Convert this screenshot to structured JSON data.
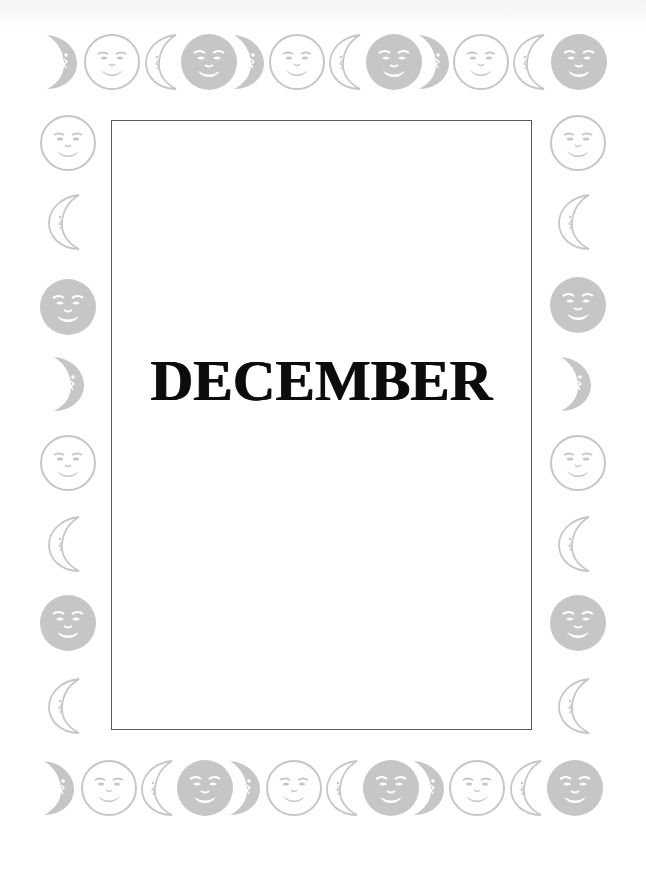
{
  "page": {
    "title": "DECEMBER",
    "colors": {
      "moon_gray": "#c6c6c6",
      "frame_border": "#5a5a5a",
      "title_ink": "#0c0c0c",
      "background": "#ffffff"
    }
  },
  "border": {
    "top_row": [
      "crescent-filled",
      "face-outline",
      "crescent-outline",
      "face-filled",
      "crescent-filled",
      "face-outline",
      "crescent-outline",
      "face-filled",
      "crescent-filled",
      "face-outline",
      "crescent-outline",
      "face-filled"
    ],
    "left_column": [
      "face-outline",
      "crescent-outline",
      "face-filled",
      "crescent-filled",
      "face-outline",
      "crescent-outline",
      "face-filled",
      "crescent-outline"
    ],
    "right_column": [
      "face-outline",
      "crescent-outline",
      "face-filled",
      "crescent-filled",
      "face-outline",
      "crescent-outline",
      "face-filled",
      "crescent-outline"
    ],
    "bottom_row": [
      "crescent-filled",
      "face-outline",
      "crescent-outline",
      "face-filled",
      "crescent-filled",
      "face-outline",
      "crescent-outline",
      "face-filled",
      "crescent-filled",
      "face-outline",
      "crescent-outline",
      "face-filled"
    ]
  }
}
